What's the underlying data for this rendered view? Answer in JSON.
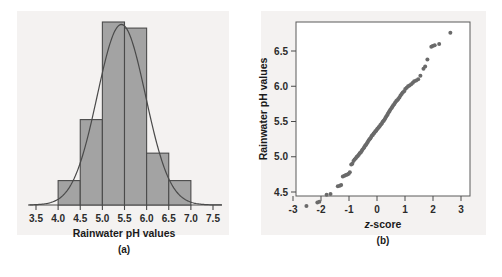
{
  "figure": {
    "background_color": "#ffffff",
    "panel_background_color": "#f4f2f1"
  },
  "chart_data": [
    {
      "id": "panel-a",
      "type": "bar",
      "title": "",
      "subtitle": "",
      "caption": "(a)",
      "xlabel": "Rainwater pH values",
      "ylabel": "",
      "xlim": [
        3.35,
        7.7
      ],
      "ylim": [
        0,
        30
      ],
      "grid": false,
      "legend": null,
      "bar_color": "#a3a3a3",
      "bar_edge_color": "#4a4a4a",
      "curve_color": "#4a4a4a",
      "curve_description": "normal density overlay curve, mean 5.43, sd 0.54",
      "xticks": [
        "3.5",
        "4.0",
        "4.5",
        "5.0",
        "5.5",
        "6.0",
        "6.5",
        "7.0",
        "7.5"
      ],
      "xtick_values": [
        3.5,
        4.0,
        4.5,
        5.0,
        5.5,
        6.0,
        6.5,
        7.0,
        7.5
      ],
      "bin_edges": [
        4.0,
        4.5,
        5.0,
        5.5,
        6.0,
        6.5,
        7.0
      ],
      "categories": [
        "4.0-4.5",
        "4.5-5.0",
        "5.0-5.5",
        "5.5-6.0",
        "6.0-6.5",
        "6.5-7.0"
      ],
      "values": [
        4,
        14,
        30,
        29,
        8.5,
        4
      ]
    },
    {
      "id": "panel-b",
      "type": "scatter",
      "title": "",
      "subtitle": "",
      "caption": "(b)",
      "xlabel": "z-score",
      "xlabel_italic_prefix": "z",
      "xlabel_rest": "-score",
      "ylabel": "Rainwater pH values",
      "xlim": [
        -3.35,
        3.35
      ],
      "ylim": [
        4.2,
        6.95
      ],
      "grid": false,
      "legend": null,
      "point_color": "#6a6a6a",
      "xticks": [
        "-3",
        "-2",
        "-1",
        "0",
        "1",
        "2",
        "3"
      ],
      "xtick_values": [
        -3,
        -2,
        -1,
        0,
        1,
        2,
        3
      ],
      "yticks": [
        "4.5",
        "5.0",
        "5.5",
        "6.0",
        "6.5"
      ],
      "ytick_values": [
        4.5,
        5.0,
        5.5,
        6.0,
        6.5
      ],
      "points": [
        [
          -2.52,
          4.3
        ],
        [
          -2.13,
          4.35
        ],
        [
          -2.06,
          4.36
        ],
        [
          -1.8,
          4.46
        ],
        [
          -1.66,
          4.47
        ],
        [
          -1.4,
          4.58
        ],
        [
          -1.33,
          4.59
        ],
        [
          -1.28,
          4.6
        ],
        [
          -1.22,
          4.72
        ],
        [
          -1.16,
          4.73
        ],
        [
          -1.11,
          4.74
        ],
        [
          -1.06,
          4.75
        ],
        [
          -1.01,
          4.76
        ],
        [
          -0.97,
          4.78
        ],
        [
          -0.92,
          4.89
        ],
        [
          -0.88,
          4.9
        ],
        [
          -0.84,
          4.94
        ],
        [
          -0.8,
          4.96
        ],
        [
          -0.76,
          4.98
        ],
        [
          -0.72,
          5.0
        ],
        [
          -0.69,
          5.01
        ],
        [
          -0.65,
          5.03
        ],
        [
          -0.62,
          5.05
        ],
        [
          -0.58,
          5.06
        ],
        [
          -0.55,
          5.08
        ],
        [
          -0.52,
          5.1
        ],
        [
          -0.48,
          5.12
        ],
        [
          -0.45,
          5.14
        ],
        [
          -0.42,
          5.16
        ],
        [
          -0.39,
          5.17
        ],
        [
          -0.36,
          5.19
        ],
        [
          -0.33,
          5.21
        ],
        [
          -0.3,
          5.23
        ],
        [
          -0.27,
          5.25
        ],
        [
          -0.24,
          5.26
        ],
        [
          -0.21,
          5.28
        ],
        [
          -0.18,
          5.3
        ],
        [
          -0.15,
          5.31
        ],
        [
          -0.12,
          5.33
        ],
        [
          -0.09,
          5.34
        ],
        [
          -0.06,
          5.36
        ],
        [
          -0.03,
          5.37
        ],
        [
          0.0,
          5.39
        ],
        [
          0.03,
          5.4
        ],
        [
          0.06,
          5.42
        ],
        [
          0.09,
          5.43
        ],
        [
          0.12,
          5.45
        ],
        [
          0.15,
          5.46
        ],
        [
          0.18,
          5.48
        ],
        [
          0.21,
          5.5
        ],
        [
          0.24,
          5.51
        ],
        [
          0.27,
          5.53
        ],
        [
          0.3,
          5.55
        ],
        [
          0.33,
          5.57
        ],
        [
          0.36,
          5.59
        ],
        [
          0.39,
          5.61
        ],
        [
          0.42,
          5.63
        ],
        [
          0.45,
          5.65
        ],
        [
          0.48,
          5.67
        ],
        [
          0.52,
          5.69
        ],
        [
          0.55,
          5.71
        ],
        [
          0.58,
          5.73
        ],
        [
          0.62,
          5.75
        ],
        [
          0.65,
          5.77
        ],
        [
          0.69,
          5.79
        ],
        [
          0.72,
          5.8
        ],
        [
          0.76,
          5.82
        ],
        [
          0.8,
          5.84
        ],
        [
          0.84,
          5.87
        ],
        [
          0.88,
          5.89
        ],
        [
          0.92,
          5.91
        ],
        [
          0.97,
          5.93
        ],
        [
          1.01,
          5.96
        ],
        [
          1.06,
          5.98
        ],
        [
          1.11,
          6.0
        ],
        [
          1.16,
          6.01
        ],
        [
          1.22,
          6.03
        ],
        [
          1.28,
          6.05
        ],
        [
          1.33,
          6.07
        ],
        [
          1.4,
          6.08
        ],
        [
          1.47,
          6.1
        ],
        [
          1.55,
          6.15
        ],
        [
          1.66,
          6.25
        ],
        [
          1.72,
          6.28
        ],
        [
          1.8,
          6.38
        ],
        [
          1.94,
          6.56
        ],
        [
          1.99,
          6.57
        ],
        [
          2.06,
          6.58
        ],
        [
          2.22,
          6.6
        ],
        [
          2.62,
          6.76
        ]
      ]
    }
  ]
}
